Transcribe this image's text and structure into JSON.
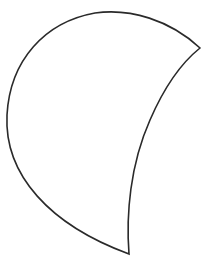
{
  "figure": {
    "type": "crescent-shape",
    "background": "#ffffff",
    "stroke_color": "#2a2a2a",
    "fill_color": "#ffffff",
    "stroke_width": 1.6,
    "path": "M 200 48 C 170 20, 130 8, 95 13 C 45 22, 10 60, 7 115 C 4 175, 50 225, 129 254 C 126 215, 130 165, 150 120 C 163 90, 180 64, 200 48 Z"
  }
}
